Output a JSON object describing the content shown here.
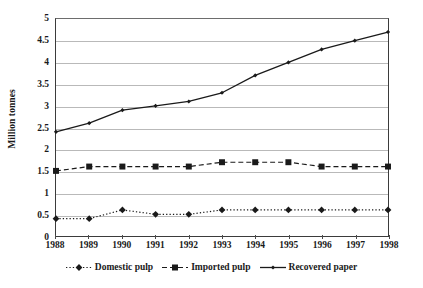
{
  "chart_data": {
    "type": "line",
    "title": "",
    "subtitle": "",
    "xlabel": "",
    "ylabel": "Million tonnes",
    "x": [
      1988,
      1989,
      1990,
      1991,
      1992,
      1993,
      1994,
      1995,
      1996,
      1997,
      1998
    ],
    "categories": [
      "1988",
      "1989",
      "1990",
      "1991",
      "1992",
      "1993",
      "1994",
      "1995",
      "1996",
      "1997",
      "1998"
    ],
    "series": [
      {
        "name": "Domestic pulp",
        "values": [
          0.4,
          0.4,
          0.6,
          0.5,
          0.5,
          0.6,
          0.6,
          0.6,
          0.6,
          0.6,
          0.6
        ],
        "line_style": "dotted",
        "marker": "diamond",
        "color": "#1a1a1a"
      },
      {
        "name": "Imported pulp",
        "values": [
          1.5,
          1.6,
          1.6,
          1.6,
          1.6,
          1.7,
          1.7,
          1.7,
          1.6,
          1.6,
          1.6
        ],
        "line_style": "dashed",
        "marker": "square",
        "color": "#1a1a1a"
      },
      {
        "name": "Recovered paper",
        "values": [
          2.4,
          2.6,
          2.9,
          3.0,
          3.1,
          3.3,
          3.7,
          4.0,
          4.3,
          4.5,
          4.7
        ],
        "line_style": "solid",
        "marker": "diamond-small",
        "color": "#1a1a1a"
      }
    ],
    "ylim": [
      0,
      5
    ],
    "ytick_labels": [
      "0",
      "0.5",
      "1",
      "1.5",
      "2",
      "2.5",
      "3",
      "3.5",
      "4",
      "4.5",
      "5"
    ],
    "ytick_values": [
      0,
      0.5,
      1,
      1.5,
      2,
      2.5,
      3,
      3.5,
      4,
      4.5,
      5
    ],
    "grid": "horizontal",
    "legend_position": "bottom",
    "legend_entries": [
      "Domestic pulp",
      "Imported pulp",
      "Recovered paper"
    ],
    "background_color": "#ffffff",
    "gridline_color": "#b9b9b9",
    "axis_color": "#3b3b3b"
  }
}
